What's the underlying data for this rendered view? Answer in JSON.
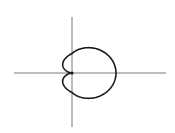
{
  "chart_data": {
    "type": "line",
    "subtype": "polar-curve",
    "title": "",
    "xlabel": "",
    "ylabel": "",
    "equation": "r = 1 + cos(θ)",
    "curve_name": "cardioid",
    "theta_range": [
      0,
      6.283185307
    ],
    "xlim": [
      -1.6,
      3.4
    ],
    "ylim": [
      -2.4,
      2.4
    ],
    "grid": false,
    "legend": "none",
    "colors": {
      "curve": "#1a1a1a",
      "axes": "#7a7a7a",
      "background": "#ffffff"
    },
    "key_points": [
      {
        "label": "cusp",
        "x": 0,
        "y": 0
      },
      {
        "label": "rightmost",
        "x": 2,
        "y": 0
      }
    ]
  }
}
